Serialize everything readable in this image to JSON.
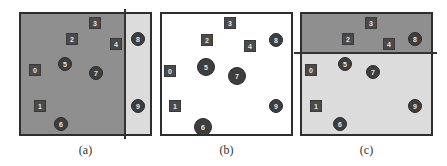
{
  "colors": {
    "dark_region": "#8f8f8f",
    "light_region": "#dcdcdc",
    "white_region": "#ffffff",
    "node_fill": "#444444",
    "border": "#2e2e2e"
  },
  "panels": [
    {
      "id": "a",
      "caption": "(a)",
      "left": 19,
      "split": {
        "orientation": "vertical",
        "position": 104
      },
      "regions": [
        {
          "name": "left",
          "color": "#8f8f8f"
        },
        {
          "name": "right",
          "color": "#dcdcdc"
        }
      ],
      "nodes": [
        {
          "label": "0",
          "shape": "square",
          "x": 14,
          "y": 56
        },
        {
          "label": "1",
          "shape": "square",
          "x": 19,
          "y": 92
        },
        {
          "label": "2",
          "shape": "square",
          "x": 51,
          "y": 25
        },
        {
          "label": "3",
          "shape": "square",
          "x": 74,
          "y": 9
        },
        {
          "label": "4",
          "shape": "square",
          "x": 95,
          "y": 30
        },
        {
          "label": "5",
          "shape": "circle",
          "x": 44,
          "y": 50,
          "r": 7
        },
        {
          "label": "6",
          "shape": "circle",
          "x": 40,
          "y": 110,
          "r": 7
        },
        {
          "label": "7",
          "shape": "circle",
          "x": 75,
          "y": 59,
          "r": 7
        },
        {
          "label": "8",
          "shape": "circle",
          "x": 117,
          "y": 25,
          "r": 7
        },
        {
          "label": "9",
          "shape": "circle",
          "x": 117,
          "y": 92,
          "r": 7
        }
      ]
    },
    {
      "id": "b",
      "caption": "(b)",
      "left": 160,
      "split": null,
      "regions": [
        {
          "name": "full",
          "color": "#ffffff"
        }
      ],
      "nodes": [
        {
          "label": "0",
          "shape": "square",
          "x": 8,
          "y": 57
        },
        {
          "label": "1",
          "shape": "square",
          "x": 13,
          "y": 92
        },
        {
          "label": "2",
          "shape": "square",
          "x": 45,
          "y": 26
        },
        {
          "label": "3",
          "shape": "square",
          "x": 68,
          "y": 9
        },
        {
          "label": "4",
          "shape": "square",
          "x": 88,
          "y": 32
        },
        {
          "label": "5",
          "shape": "circle",
          "x": 44,
          "y": 53,
          "r": 9
        },
        {
          "label": "6",
          "shape": "circle",
          "x": 41,
          "y": 113,
          "r": 9
        },
        {
          "label": "7",
          "shape": "circle",
          "x": 75,
          "y": 62,
          "r": 9
        },
        {
          "label": "8",
          "shape": "circle",
          "x": 114,
          "y": 26,
          "r": 7
        },
        {
          "label": "9",
          "shape": "circle",
          "x": 114,
          "y": 92,
          "r": 7
        }
      ]
    },
    {
      "id": "c",
      "caption": "(c)",
      "left": 300,
      "split": {
        "orientation": "horizontal",
        "position": 39
      },
      "regions": [
        {
          "name": "top",
          "color": "#8f8f8f"
        },
        {
          "name": "bottom",
          "color": "#dcdcdc"
        }
      ],
      "nodes": [
        {
          "label": "0",
          "shape": "square",
          "x": 9,
          "y": 56
        },
        {
          "label": "1",
          "shape": "square",
          "x": 14,
          "y": 92
        },
        {
          "label": "2",
          "shape": "square",
          "x": 46,
          "y": 25
        },
        {
          "label": "3",
          "shape": "square",
          "x": 69,
          "y": 9
        },
        {
          "label": "4",
          "shape": "square",
          "x": 87,
          "y": 30
        },
        {
          "label": "5",
          "shape": "circle",
          "x": 43,
          "y": 50,
          "r": 7
        },
        {
          "label": "6",
          "shape": "circle",
          "x": 38,
          "y": 110,
          "r": 7
        },
        {
          "label": "7",
          "shape": "circle",
          "x": 71,
          "y": 58,
          "r": 7
        },
        {
          "label": "8",
          "shape": "circle",
          "x": 113,
          "y": 25,
          "r": 7
        },
        {
          "label": "9",
          "shape": "circle",
          "x": 113,
          "y": 92,
          "r": 7
        }
      ]
    }
  ]
}
